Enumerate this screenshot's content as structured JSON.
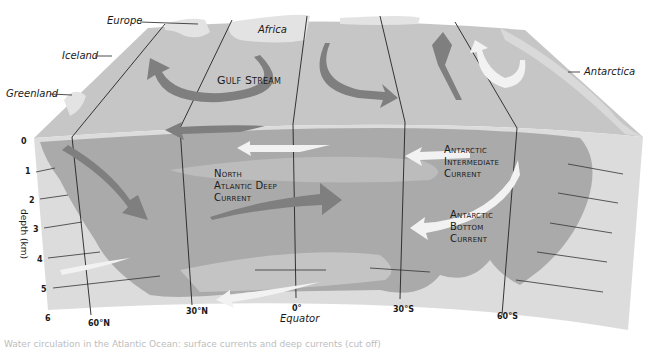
{
  "diagram": {
    "colors": {
      "surface_top": "#c8c8c8",
      "land": "#e6e6e6",
      "water_deep": "#a9a9a9",
      "water_mid": "#bcbcbc",
      "water_light": "#d2d2d2",
      "seafloor": "#dcdcdc",
      "dark_arrow": "#7d7d7d",
      "light_arrow": "#f2f2f2",
      "line": "#222222"
    },
    "places": [
      {
        "id": "europe",
        "label": "Europe"
      },
      {
        "id": "africa",
        "label": "Africa"
      },
      {
        "id": "iceland",
        "label": "Iceland"
      },
      {
        "id": "greenland",
        "label": "Greenland"
      },
      {
        "id": "antarctica",
        "label": "Antarctica"
      }
    ],
    "currents": [
      {
        "id": "gulf-stream",
        "label": "Gulf Stream"
      },
      {
        "id": "north-atlantic-deep",
        "label": "North\nAtlantic Deep\nCurrent"
      },
      {
        "id": "antarctic-intermediate",
        "label": "Antarctic\nIntermediate\nCurrent"
      },
      {
        "id": "antarctic-bottom",
        "label": "Antarctic\nBottom\nCurrent"
      }
    ],
    "depth_axis": {
      "title": "depth (km)",
      "ticks": [
        "0",
        "1",
        "2",
        "3",
        "4",
        "5",
        "6"
      ]
    },
    "latitude_axis": {
      "ticks": [
        "60°N",
        "30°N",
        "0°",
        "30°S",
        "60°S"
      ],
      "equator_label": "Equator"
    },
    "caption": "Water circulation in the Atlantic Ocean: surface currents and deep currents (cut off)"
  }
}
